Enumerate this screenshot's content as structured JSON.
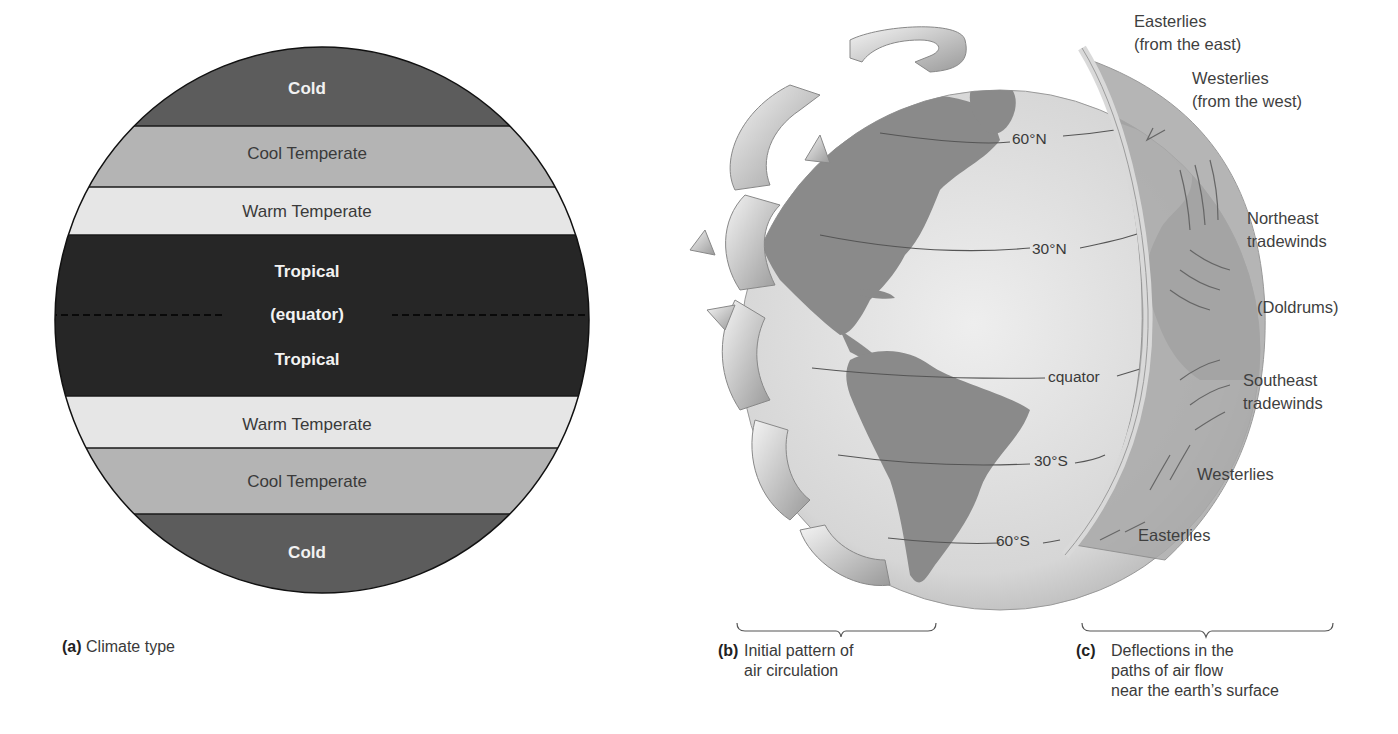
{
  "panel_a": {
    "bands": [
      {
        "label": "Cold",
        "color": "#5c5c5c",
        "text_style": "bold-light"
      },
      {
        "label": "Cool Temperate",
        "color": "#b4b4b4",
        "text_style": "regular-dark"
      },
      {
        "label": "Warm Temperate",
        "color": "#e6e6e6",
        "text_style": "regular-dark"
      },
      {
        "label": "Tropical",
        "color": "#262626",
        "text_style": "bold-light"
      },
      {
        "label": "(equator)",
        "color": "#262626",
        "text_style": "bold-light"
      },
      {
        "label": "Tropical",
        "color": "#262626",
        "text_style": "bold-light"
      },
      {
        "label": "Warm Temperate",
        "color": "#e6e6e6",
        "text_style": "regular-dark"
      },
      {
        "label": "Cool Temperate",
        "color": "#b4b4b4",
        "text_style": "regular-dark"
      },
      {
        "label": "Cold",
        "color": "#5c5c5c",
        "text_style": "bold-light"
      }
    ],
    "caption_letter": "(a)",
    "caption_text": "Climate type"
  },
  "panel_b": {
    "latitude_labels": [
      "60°N",
      "30°N",
      "cquator",
      "30°S",
      "60°S"
    ],
    "caption_letter": "(b)",
    "caption_lines": [
      "Initial pattern of",
      "air circulation"
    ]
  },
  "panel_c": {
    "wind_labels": [
      [
        "Easterlies",
        "(from the east)"
      ],
      [
        "Westerlies",
        "(from the west)"
      ],
      [
        "Northeast",
        "tradewinds"
      ],
      [
        "(Doldrums)"
      ],
      [
        "Southeast",
        "tradewinds"
      ],
      [
        "Westerlies"
      ],
      [
        "Easterlies"
      ]
    ],
    "caption_letter": "(c)",
    "caption_lines": [
      "Deflections in the",
      "paths of air flow",
      "near the earth’s surface"
    ]
  }
}
